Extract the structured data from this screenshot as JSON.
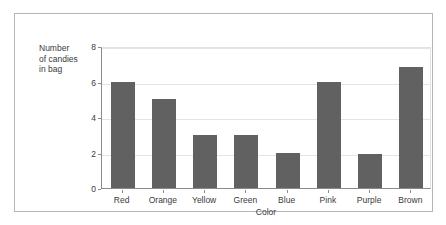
{
  "top_cut_text": {
    "fragments": [
      {
        "text": "AT 3.0%",
        "left": 14
      },
      {
        "text": "AT 2.0%",
        "left": 128
      },
      {
        "text": "AT 2.0%",
        "left": 243
      },
      {
        "text": "AT 5.0%",
        "left": 355
      }
    ]
  },
  "chart_data": {
    "type": "bar",
    "title": "",
    "xlabel": "Color",
    "ylabel": "Number of candies in bag",
    "categories": [
      "Red",
      "Orange",
      "Yellow",
      "Green",
      "Blue",
      "Pink",
      "Purple",
      "Brown"
    ],
    "values": [
      6,
      5,
      3,
      3,
      2,
      6,
      1.9,
      6.8
    ],
    "ylim": [
      0,
      8
    ],
    "yticks": [
      0,
      2,
      4,
      6,
      8
    ],
    "ytick_labels": [
      "0",
      "2",
      "4",
      "6",
      "8"
    ],
    "grid": true,
    "legend": "none",
    "bar_color": "#616161",
    "gridline_color": "#e4e4e4",
    "axis_color": "#8a8a8a",
    "frame_color": "#b5b5b5",
    "background": "#ffffff"
  },
  "axis_titles": {
    "y_line1": "Number",
    "y_line2": "of candies",
    "y_line3": "in bag",
    "x": "Color"
  }
}
